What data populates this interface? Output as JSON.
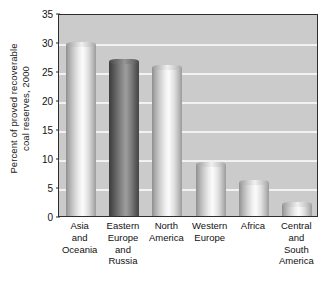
{
  "chart_data": {
    "type": "bar",
    "title": "",
    "xlabel": "",
    "ylabel": "Percent of proved recoverable\ncoal reserves, 2000",
    "categories": [
      "Asia\nand\nOceania",
      "Eastern\nEurope\nand\nRussia",
      "North\nAmerica",
      "Western\nEurope",
      "Africa",
      "Central\nand\nSouth\nAmerica"
    ],
    "values": [
      30.0,
      27.0,
      26.0,
      9.3,
      6.2,
      2.4
    ],
    "ylim": [
      0,
      35
    ],
    "yticks": [
      0,
      5,
      10,
      15,
      20,
      25,
      30,
      35
    ],
    "ytick_labels": [
      "0",
      "5",
      "10",
      "15",
      "20",
      "25",
      "30",
      "35"
    ],
    "grid": true,
    "legend": false,
    "bar_styles": [
      "light",
      "dark",
      "light",
      "light",
      "light",
      "light"
    ],
    "colors": {
      "plot_background": "#cbcbcb",
      "gridline": "#f2f2f2",
      "axis_border": "#2e2e2e",
      "text": "#111111",
      "bar_light_peak": "#fbfbfb",
      "bar_dark_peak": "#9d9d9d"
    }
  }
}
